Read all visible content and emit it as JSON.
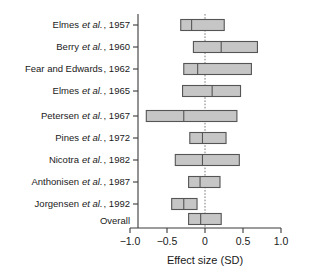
{
  "chart_data": {
    "type": "bar",
    "subtype": "forest-plot",
    "title": "",
    "xlabel": "Effect size (SD)",
    "ylabel": "",
    "xlim": [
      -1.0,
      1.5
    ],
    "xticks": [
      -1.0,
      -0.5,
      0,
      0.5,
      1.0,
      1.5
    ],
    "xticklabels": [
      "−1.0",
      "−0.5",
      "0",
      "0.5",
      "1.0",
      "1.5"
    ],
    "grid": false,
    "legend": null,
    "reference_line": 0,
    "reference_line_style": "dotted",
    "categories": [
      "Elmes et al., 1957",
      "Berry et al., 1960",
      "Fear and Edwards, 1962",
      "Elmes et al., 1965",
      "Petersen et al., 1967",
      "Pines et al., 1972",
      "Nicotra et al., 1982",
      "Anthonisen et al., 1987",
      "Jorgensen et al., 1992",
      "Overall"
    ],
    "studies": [
      {
        "author": "Elmes",
        "author_suffix": "et al.",
        "year": "1957",
        "label_plain": "Elmes et al., 1957",
        "estimate": 0.02,
        "ci_low": -0.16,
        "ci_high": 0.56
      },
      {
        "author": "Berry",
        "author_suffix": "et al.",
        "year": "1960",
        "label_plain": "Berry et al., 1960",
        "estimate": 0.51,
        "ci_low": 0.05,
        "ci_high": 1.11
      },
      {
        "author": "Fear and Edwards",
        "author_suffix": "",
        "year": "1962",
        "label_plain": "Fear and Edwards, 1962",
        "estimate": 0.12,
        "ci_low": -0.11,
        "ci_high": 1.01
      },
      {
        "author": "Elmes",
        "author_suffix": "et al.",
        "year": "1965",
        "label_plain": "Elmes et al., 1965",
        "estimate": 0.36,
        "ci_low": -0.13,
        "ci_high": 0.83
      },
      {
        "author": "Petersen",
        "author_suffix": "et al.",
        "year": "1967",
        "label_plain": "Petersen et al., 1967",
        "estimate": -0.11,
        "ci_low": -0.73,
        "ci_high": 0.77
      },
      {
        "author": "Pines",
        "author_suffix": "et al.",
        "year": "1972",
        "label_plain": "Pines et al., 1972",
        "estimate": 0.2,
        "ci_low": -0.01,
        "ci_high": 0.59
      },
      {
        "author": "Nicotra",
        "author_suffix": "et al.",
        "year": "1982",
        "label_plain": "Nicotra et al., 1982",
        "estimate": 0.2,
        "ci_low": -0.25,
        "ci_high": 0.81
      },
      {
        "author": "Anthonisen",
        "author_suffix": "et al.",
        "year": "1987",
        "label_plain": "Anthonisen et al., 1987",
        "estimate": 0.16,
        "ci_low": -0.03,
        "ci_high": 0.49
      },
      {
        "author": "Jorgensen",
        "author_suffix": "et al.",
        "year": "1992",
        "label_plain": "Jorgensen et al., 1992",
        "estimate": -0.11,
        "ci_low": -0.31,
        "ci_high": 0.11
      },
      {
        "author": "Overall",
        "author_suffix": "",
        "year": "",
        "label_plain": "Overall",
        "estimate": 0.17,
        "ci_low": -0.03,
        "ci_high": 0.51
      }
    ],
    "values": [
      0.02,
      0.51,
      0.12,
      0.36,
      -0.11,
      0.2,
      0.2,
      0.16,
      -0.11,
      0.17
    ],
    "ci_low": [
      -0.16,
      0.05,
      -0.11,
      -0.13,
      -0.73,
      -0.01,
      -0.25,
      -0.03,
      -0.31,
      -0.03
    ],
    "ci_high": [
      0.56,
      1.11,
      1.01,
      0.83,
      0.77,
      0.59,
      0.81,
      0.49,
      0.11,
      0.51
    ]
  },
  "colors": {
    "box_fill": "#c6c6c6",
    "box_stroke": "#555555",
    "axis": "#3a3a3a",
    "zero_line": "#7a7a7a",
    "text": "#1a1a1a",
    "background": "#ffffff"
  }
}
